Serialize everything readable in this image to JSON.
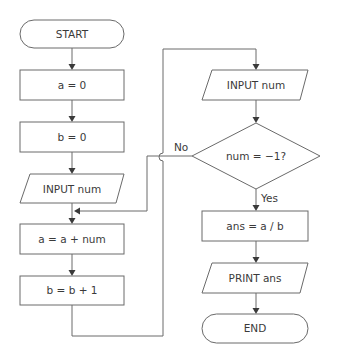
{
  "flowchart": {
    "nodes": {
      "start": {
        "type": "terminal",
        "label": "START"
      },
      "set_a": {
        "type": "process",
        "label": "a = 0"
      },
      "set_b": {
        "type": "process",
        "label": "b = 0"
      },
      "input_first": {
        "type": "input",
        "label": "INPUT num"
      },
      "add_a": {
        "type": "process",
        "label": "a = a + num"
      },
      "inc_b": {
        "type": "process",
        "label": "b = b + 1"
      },
      "input_loop": {
        "type": "input",
        "label": "INPUT num"
      },
      "decision": {
        "type": "decision",
        "label": "num = −1?"
      },
      "calc": {
        "type": "process",
        "label": "ans = a / b"
      },
      "print": {
        "type": "output",
        "label": "PRINT ans"
      },
      "end": {
        "type": "terminal",
        "label": "END"
      }
    },
    "edge_labels": {
      "no": "No",
      "yes": "Yes"
    },
    "colors": {
      "stroke": "#6a6a6a",
      "text": "#3a3a3a",
      "background": "#ffffff"
    }
  }
}
